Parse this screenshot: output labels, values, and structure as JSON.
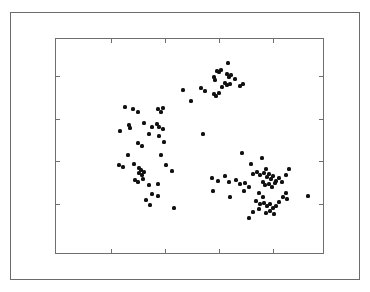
{
  "figure": {
    "title": "",
    "background_color": "#ffffff",
    "frame_color": "#6b6b6b",
    "axes_color": "#6f6f6f",
    "point_color": "#111111"
  },
  "chart_data": {
    "type": "scatter",
    "title": "",
    "xlabel": "",
    "ylabel": "",
    "xlim": [
      0,
      1
    ],
    "ylim": [
      0,
      1
    ],
    "grid": false,
    "legend": null,
    "tick_labels": {
      "x": [],
      "y": []
    },
    "xticks_px": [
      110,
      164,
      218,
      272
    ],
    "yticks_px": [
      75,
      118,
      160,
      203
    ],
    "marker": "filled-circle",
    "marker_size_px": 3.2,
    "n_points": 118,
    "series": [
      {
        "name": "points",
        "color": "#111111",
        "points_px": [
          [
            227,
            62
          ],
          [
            216,
            70
          ],
          [
            218,
            71
          ],
          [
            220,
            69
          ],
          [
            213,
            76
          ],
          [
            214,
            79
          ],
          [
            226,
            73
          ],
          [
            228,
            76
          ],
          [
            230,
            74
          ],
          [
            224,
            82
          ],
          [
            226,
            84
          ],
          [
            229,
            83
          ],
          [
            234,
            78
          ],
          [
            239,
            85
          ],
          [
            242,
            83
          ],
          [
            221,
            86
          ],
          [
            182,
            89
          ],
          [
            190,
            100
          ],
          [
            200,
            87
          ],
          [
            204,
            90
          ],
          [
            213,
            93
          ],
          [
            215,
            95
          ],
          [
            218,
            92
          ],
          [
            124,
            106
          ],
          [
            132,
            108
          ],
          [
            137,
            111
          ],
          [
            157,
            108
          ],
          [
            162,
            107
          ],
          [
            160,
            111
          ],
          [
            128,
            124
          ],
          [
            129,
            127
          ],
          [
            143,
            122
          ],
          [
            151,
            126
          ],
          [
            156,
            123
          ],
          [
            158,
            126
          ],
          [
            162,
            128
          ],
          [
            119,
            130
          ],
          [
            148,
            133
          ],
          [
            158,
            135
          ],
          [
            202,
            133
          ],
          [
            137,
            142
          ],
          [
            141,
            145
          ],
          [
            163,
            141
          ],
          [
            127,
            154
          ],
          [
            160,
            154
          ],
          [
            118,
            164
          ],
          [
            122,
            166
          ],
          [
            133,
            163
          ],
          [
            138,
            167
          ],
          [
            140,
            169
          ],
          [
            138,
            172
          ],
          [
            141,
            174
          ],
          [
            143,
            171
          ],
          [
            165,
            164
          ],
          [
            171,
            170
          ],
          [
            134,
            179
          ],
          [
            137,
            181
          ],
          [
            142,
            178
          ],
          [
            148,
            184
          ],
          [
            157,
            183
          ],
          [
            151,
            193
          ],
          [
            157,
            195
          ],
          [
            149,
            204
          ],
          [
            241,
            152
          ],
          [
            250,
            163
          ],
          [
            261,
            157
          ],
          [
            265,
            168
          ],
          [
            252,
            173
          ],
          [
            256,
            171
          ],
          [
            259,
            174
          ],
          [
            263,
            172
          ],
          [
            266,
            176
          ],
          [
            268,
            173
          ],
          [
            270,
            178
          ],
          [
            272,
            175
          ],
          [
            275,
            180
          ],
          [
            278,
            177
          ],
          [
            262,
            181
          ],
          [
            264,
            184
          ],
          [
            268,
            183
          ],
          [
            271,
            186
          ],
          [
            274,
            182
          ],
          [
            281,
            181
          ],
          [
            285,
            174
          ],
          [
            288,
            168
          ],
          [
            211,
            177
          ],
          [
            217,
            180
          ],
          [
            224,
            175
          ],
          [
            228,
            181
          ],
          [
            235,
            179
          ],
          [
            239,
            183
          ],
          [
            244,
            182
          ],
          [
            248,
            186
          ],
          [
            212,
            190
          ],
          [
            229,
            196
          ],
          [
            243,
            190
          ],
          [
            258,
            192
          ],
          [
            262,
            196
          ],
          [
            255,
            200
          ],
          [
            259,
            203
          ],
          [
            263,
            202
          ],
          [
            266,
            205
          ],
          [
            269,
            203
          ],
          [
            272,
            207
          ],
          [
            275,
            205
          ],
          [
            278,
            201
          ],
          [
            282,
            196
          ],
          [
            285,
            192
          ],
          [
            286,
            198
          ],
          [
            252,
            211
          ],
          [
            258,
            208
          ],
          [
            265,
            212
          ],
          [
            269,
            210
          ],
          [
            273,
            213
          ],
          [
            248,
            217
          ],
          [
            307,
            195
          ],
          [
            173,
            207
          ],
          [
            145,
            199
          ]
        ]
      }
    ]
  }
}
